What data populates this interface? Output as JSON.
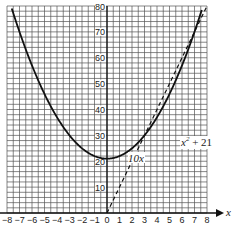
{
  "chart_data": {
    "type": "line",
    "title": "",
    "xlabel": "x",
    "ylabel": "",
    "xlim": [
      -8,
      8
    ],
    "ylim": [
      0,
      80
    ],
    "grid": true,
    "x_ticks": [
      "-8",
      "-7",
      "-6",
      "-5",
      "-4",
      "-3",
      "-2",
      "-1",
      "0",
      "1",
      "2",
      "3",
      "4",
      "5",
      "6",
      "7",
      "8"
    ],
    "y_ticks": [
      "10",
      "20",
      "30",
      "40",
      "50",
      "60",
      "70",
      "80"
    ],
    "series": [
      {
        "name": "x^2 + 21",
        "label": "x² + 21",
        "style": "solid",
        "x": [
          -7.6,
          -7,
          -6,
          -5,
          -4,
          -3,
          -2,
          -1,
          0,
          1,
          2,
          3,
          4,
          5,
          6,
          7.6
        ],
        "values": [
          78.8,
          70,
          57,
          46,
          37,
          30,
          25,
          22,
          21,
          22,
          25,
          30,
          37,
          46,
          57,
          78.8
        ]
      },
      {
        "name": "10x",
        "label": "10x",
        "style": "dashed",
        "x": [
          0,
          8
        ],
        "values": [
          0,
          80
        ]
      }
    ],
    "annotations": [
      {
        "text": "x² + 21",
        "near_x": 5.3,
        "near_y": 45
      },
      {
        "text": "10x",
        "near_x": 2.3,
        "near_y": 24
      }
    ],
    "intersections": [
      [
        3,
        30
      ],
      [
        7,
        70
      ]
    ]
  },
  "labels": {
    "x_axis": "x",
    "curve": "x",
    "curve_sup": "2",
    "curve_rest": " + 21",
    "line": "10x"
  }
}
